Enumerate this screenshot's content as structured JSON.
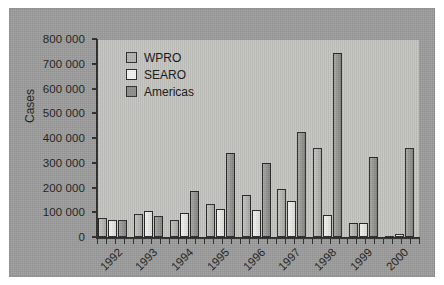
{
  "chart_data": {
    "type": "bar",
    "title": "",
    "xlabel": "",
    "ylabel": "Cases",
    "ylim": [
      0,
      800000
    ],
    "ytick_step": 100000,
    "grid": false,
    "legend_position": "upper-left-inside",
    "categories": [
      "1992",
      "1993",
      "1994",
      "1995",
      "1996",
      "1997",
      "1998",
      "1999",
      "2000"
    ],
    "ytick_labels": [
      "800 000",
      "700 000",
      "600 000",
      "500 000",
      "400 000",
      "300 000",
      "200 000",
      "100 000",
      "0"
    ],
    "series": [
      {
        "name": "WPRO",
        "color": "#b4b4b0",
        "values": [
          78000,
          93000,
          70000,
          135000,
          170000,
          195000,
          360000,
          55000,
          5000
        ]
      },
      {
        "name": "SEARO",
        "color": "#f0f0ec",
        "values": [
          68000,
          105000,
          98000,
          112000,
          108000,
          145000,
          88000,
          58000,
          13000
        ]
      },
      {
        "name": "Americas",
        "color": "#8e8e8a",
        "values": [
          67000,
          85000,
          185000,
          340000,
          300000,
          425000,
          745000,
          325000,
          360000
        ]
      }
    ]
  }
}
